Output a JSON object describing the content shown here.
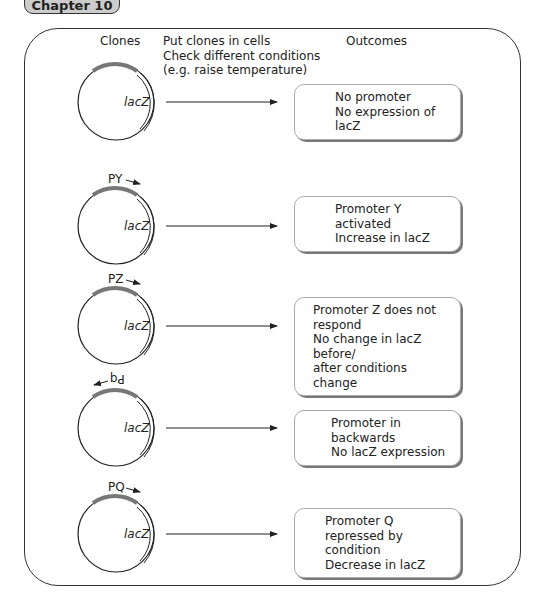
{
  "chapter_tab": "Chapter 10",
  "headers": {
    "clones": "Clones",
    "outcomes": "Outcomes"
  },
  "instructions": [
    "Put clones in cells",
    "Check different conditions",
    "(e.g. raise temperature)"
  ],
  "gene_label": "lacZ",
  "rows": [
    {
      "promoter": "",
      "direction": "none",
      "outcome": [
        "No promoter",
        "No expression of lacZ"
      ]
    },
    {
      "promoter": "PY",
      "direction": "forward",
      "outcome": [
        "Promoter Y activated",
        "Increase in lacZ"
      ]
    },
    {
      "promoter": "PZ",
      "direction": "forward",
      "outcome": [
        "Promoter Z does not respond",
        "No change in lacZ before/",
        "after conditions change"
      ]
    },
    {
      "promoter": "Pq",
      "direction": "backward",
      "outcome": [
        "Promoter in backwards",
        "No lacZ expression"
      ]
    },
    {
      "promoter": "PQ",
      "direction": "forward",
      "outcome": [
        "Promoter Q repressed by",
        "condition",
        "Decrease in lacZ"
      ]
    }
  ]
}
